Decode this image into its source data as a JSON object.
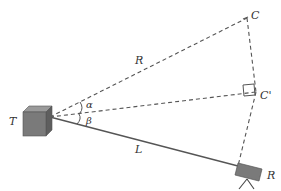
{
  "diagram": {
    "type": "geometry-triangulation",
    "labels": {
      "transmitter": "T",
      "receiver": "R",
      "point_c": "C",
      "point_c_prime": "C'",
      "dist_r": "R",
      "dist_l": "L",
      "angle_alpha": "α",
      "angle_beta": "β"
    },
    "colors": {
      "line": "#555555",
      "box_fill": "#7a7a7a",
      "box_top": "#9a9a9a",
      "box_side": "#5e5e5e",
      "text": "#333333"
    },
    "edges": [
      {
        "from": "T",
        "to": "C",
        "style": "dashed",
        "label": "R"
      },
      {
        "from": "T",
        "to": "C'",
        "style": "dashed"
      },
      {
        "from": "T",
        "to": "R",
        "style": "solid",
        "label": "L"
      },
      {
        "from": "C",
        "to": "C'",
        "style": "dashed"
      },
      {
        "from": "C'",
        "to": "R",
        "style": "dashed"
      }
    ],
    "annotations": [
      "right-angle at C'",
      "angle α between TC and TC'",
      "angle β between TC' and TR"
    ]
  }
}
